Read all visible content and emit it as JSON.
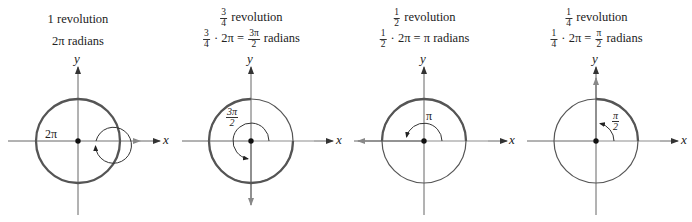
{
  "panels": [
    {
      "line1": "1 revolution",
      "line2": "2π radians",
      "angle_label": "2π",
      "axis_x": "x",
      "axis_y": "y"
    },
    {
      "line1_frac": {
        "num": "3",
        "den": "4"
      },
      "line1": "revolution",
      "line2_frac": {
        "num": "3",
        "den": "4"
      },
      "line2_mid": "· 2π =",
      "line2_result_frac": {
        "num": "3π",
        "den": "2"
      },
      "line2_end": "radians",
      "angle_label": {
        "num": "3π",
        "den": "2"
      },
      "axis_x": "x",
      "axis_y": "y"
    },
    {
      "line1_frac": {
        "num": "1",
        "den": "2"
      },
      "line1": "revolution",
      "line2_frac": {
        "num": "1",
        "den": "2"
      },
      "line2_mid": "· 2π = π radians",
      "angle_label": "π",
      "axis_x": "x",
      "axis_y": "y"
    },
    {
      "line1_frac": {
        "num": "1",
        "den": "4"
      },
      "line1": "revolution",
      "line2_frac": {
        "num": "1",
        "den": "4"
      },
      "line2_mid": "· 2π =",
      "line2_result_frac": {
        "num": "π",
        "den": "2"
      },
      "line2_end": "radians",
      "angle_label": {
        "num": "π",
        "den": "2"
      },
      "axis_x": "x",
      "axis_y": "y"
    }
  ],
  "colors": {
    "axis": "#555555",
    "circle": "#555555",
    "initial_side": "#bbbbbb",
    "terminal_side": "#888888"
  }
}
